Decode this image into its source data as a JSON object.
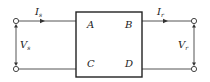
{
  "diagram": {
    "box": {
      "labels": {
        "top_left": "A",
        "top_right": "B",
        "bottom_left": "C",
        "bottom_right": "D"
      }
    },
    "sending_end": {
      "current": {
        "symbol": "I",
        "subscript": "s",
        "direction": "into-box"
      },
      "voltage": {
        "symbol": "V",
        "subscript": "s"
      }
    },
    "receiving_end": {
      "current": {
        "symbol": "I",
        "subscript": "r",
        "direction": "out-of-box"
      },
      "voltage": {
        "symbol": "V",
        "subscript": "r"
      }
    },
    "colors": {
      "line": "#555555",
      "box_border": "#222222",
      "text": "#222222",
      "background": "#ffffff"
    }
  }
}
